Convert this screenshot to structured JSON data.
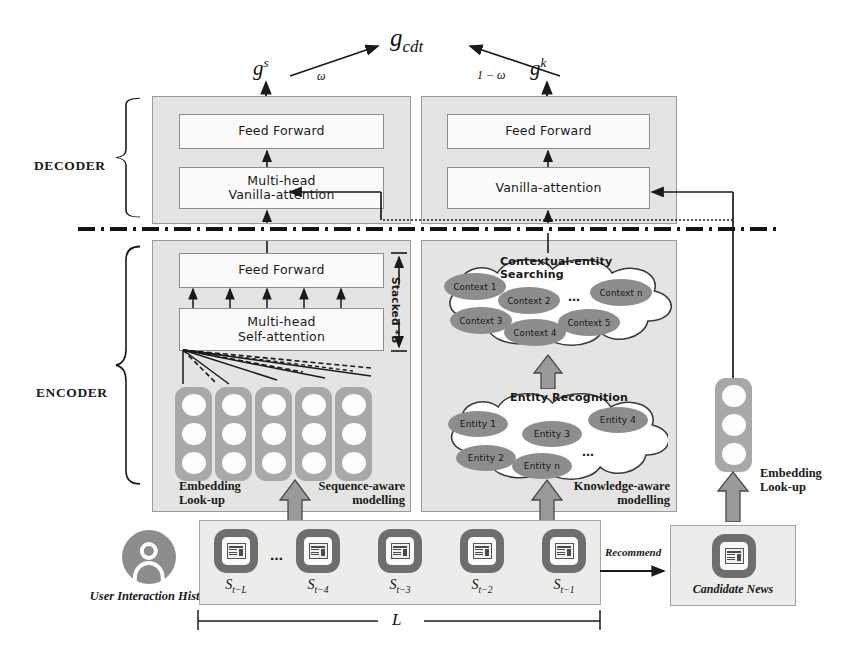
{
  "figure": {
    "fusion": {
      "output": "g_cdt",
      "left_gate": "g^s",
      "right_gate": "g^k",
      "left_weight": "ω",
      "right_weight": "1 − ω"
    },
    "side_labels": {
      "decoder": "DECODER",
      "encoder": "ENCODER"
    },
    "left_branch": {
      "name": "Sequence-aware modelling",
      "caption_line1": "Sequence-aware",
      "caption_line2": "modelling",
      "decoder_blocks": [
        {
          "label": "Feed Forward"
        },
        {
          "label_line1": "Multi-head",
          "label_line2": "Vanilla-attention"
        }
      ],
      "encoder_blocks": [
        {
          "label": "Feed Forward"
        },
        {
          "label_line1": "Multi-head",
          "label_line2": "Self-attention"
        }
      ],
      "stacked_label": "Stacked *B",
      "embedding_label_line1": "Embedding",
      "embedding_label_line2": "Look-up",
      "token_columns": 5,
      "cells_per_column": 3
    },
    "right_branch": {
      "name": "Knowledge-aware modelling",
      "caption_line1": "Knowledge-aware",
      "caption_line2": "modelling",
      "decoder_blocks": [
        {
          "label": "Feed Forward"
        },
        {
          "label": "Vanilla-attention"
        }
      ],
      "context_cloud": {
        "title": "Contextual-entity Searching",
        "nodes": [
          "Context 1",
          "Context 2",
          "Context n",
          "Context 3",
          "Context 4",
          "Context 5"
        ],
        "ellipsis": "…"
      },
      "entity_cloud": {
        "title": "Entity Recognition",
        "nodes": [
          "Entity 1",
          "Entity 4",
          "Entity 3",
          "Entity 2",
          "Entity n"
        ],
        "ellipsis": "…"
      }
    },
    "history": {
      "avatar_label": "User Interaction History",
      "sequence_ellipsis": "…",
      "items": [
        {
          "label": "S",
          "sub": "t−L"
        },
        {
          "label": "S",
          "sub": "t−4"
        },
        {
          "label": "S",
          "sub": "t−3"
        },
        {
          "label": "S",
          "sub": "t−2"
        },
        {
          "label": "S",
          "sub": "t−1"
        }
      ],
      "span_label": "L"
    },
    "candidate": {
      "recommend_label": "Recommend",
      "panel_label": "Candidate News",
      "embedding_label_line1": "Embedding",
      "embedding_label_line2": "Look-up",
      "cells": 3
    },
    "colors": {
      "panel_fill": "#e4e4e2",
      "box_fill": "#fbfbfb",
      "token_gray": "#a8a8a8",
      "node_gray": "#8d8d8d",
      "card_gray": "#6e6e6e",
      "line": "#1a1a1a"
    }
  }
}
